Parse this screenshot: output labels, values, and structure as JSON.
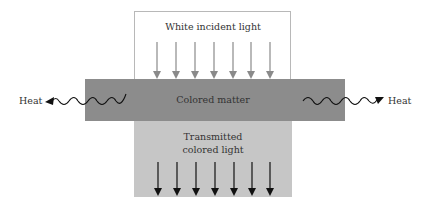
{
  "diagram": {
    "incident_label": "White incident light",
    "matter_label": "Colored matter",
    "transmitted_label_line1": "Transmitted",
    "transmitted_label_line2": "colored light",
    "heat_left_label": "Heat",
    "heat_right_label": "Heat",
    "incident_arrow_count": 7,
    "transmitted_arrow_count": 7
  },
  "colors": {
    "incident_box_border": "#b8b8b8",
    "incident_arrow": "#8a8a8a",
    "matter_fill": "#8c8c8c",
    "transmitted_fill": "#c6c6c6",
    "transmitted_arrow": "#111111",
    "heat_wave": "#111111"
  }
}
